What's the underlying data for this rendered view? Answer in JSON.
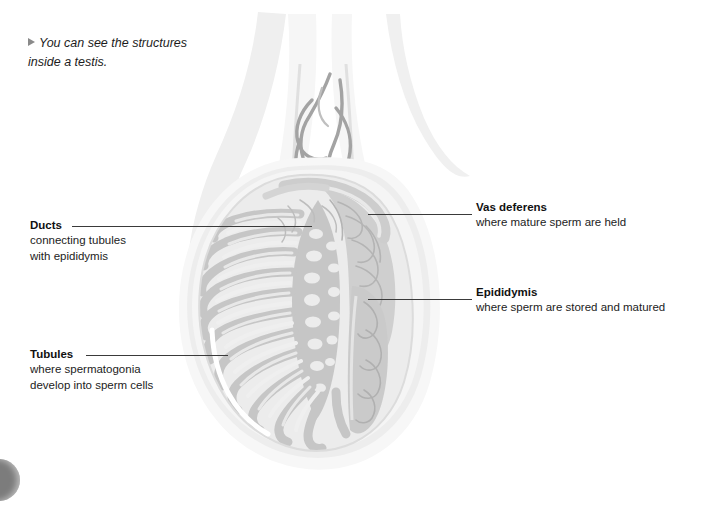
{
  "figure": {
    "caption_marker": "triangle-bullet",
    "caption_line1": "You can see the structures",
    "caption_line2": "inside a testis.",
    "alt": "Cross-section diagram of a human testis showing tubules, ducts, epididymis and vas deferens"
  },
  "labels": {
    "ducts": {
      "title": "Ducts",
      "desc_line1": "connecting tubules",
      "desc_line2": "with epididymis"
    },
    "tubules": {
      "title": "Tubules",
      "desc_line1": "where spermatogonia",
      "desc_line2": "develop into sperm cells"
    },
    "vas_deferens": {
      "title": "Vas deferens",
      "desc_line1": "where mature sperm are held"
    },
    "epididymis": {
      "title": "Epididymis",
      "desc_line1": "where sperm are stored and matured"
    }
  },
  "colors": {
    "page_background": "#ffffff",
    "text": "#1c1c1c",
    "title_text": "#111111",
    "leader_line": "#3a3a3a",
    "caption_marker": "#8a8a8a",
    "tunica_outer": "#f2f2f2",
    "tunica_mid": "#e4e4e4",
    "parenchyma": "#ededed",
    "tubule_gray": "#c9c9c9",
    "septa_light": "#e8e8e8",
    "epididymis_gray": "#c2c2c2",
    "vessel_gray": "#9a9a9a",
    "corner_dot": "#7c7c7c"
  }
}
